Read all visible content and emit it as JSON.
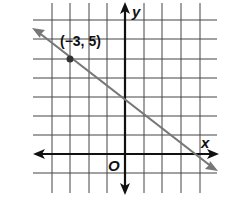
{
  "figure": {
    "type": "coordinate-graph",
    "axes": {
      "x_label": "x",
      "y_label": "y",
      "origin_label": "O",
      "x_gridlines": [
        -4,
        -3,
        -2,
        -1,
        0,
        1,
        2,
        3,
        4
      ],
      "y_gridlines": [
        -1,
        0,
        1,
        2,
        3,
        4,
        5,
        6,
        7
      ]
    },
    "line": {
      "point": {
        "x": -3,
        "y": 5
      },
      "point_label": "(−3, 5)",
      "slope_approx": -0.75,
      "y_intercept_approx": 2.75,
      "color": "#777777"
    },
    "colors": {
      "grid": "#333333",
      "axes": "#111111",
      "line": "#777777",
      "point": "#333333"
    }
  }
}
